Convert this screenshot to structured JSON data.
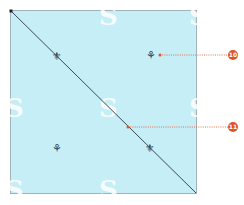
{
  "diagram": {
    "background_color": "#c6eef6",
    "border_color": "#9fb3b8",
    "diagonal_color": "#3a4a55",
    "callout_color": "#e0522a",
    "watermark_glyph": "S",
    "motifs": [
      {
        "name": "fleur-de-lis",
        "glyph": "⚜"
      },
      {
        "name": "sprig",
        "glyph": "⚘"
      }
    ],
    "callouts": [
      {
        "number": "10",
        "target": "sprig motif (upper right)"
      },
      {
        "number": "11",
        "target": "diagonal seam line"
      }
    ]
  }
}
